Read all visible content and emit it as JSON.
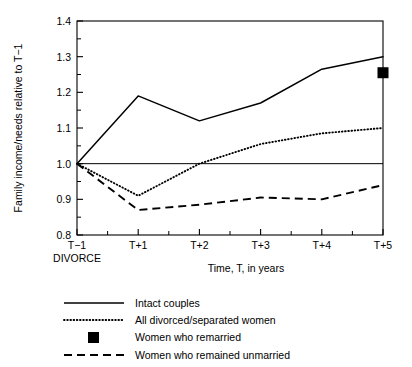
{
  "chart_data": {
    "type": "line",
    "title": "",
    "xlabel": "Time, T, in years",
    "ylabel": "Family income/needs relative to T−1",
    "categories": [
      "T−1",
      "T+1",
      "T+2",
      "T+3",
      "T+4",
      "T+5"
    ],
    "x_tick_labels": [
      "T−1",
      "T+1",
      "T+2",
      "T+3",
      "T+4",
      "T+5"
    ],
    "x_sub_label": "DIVORCE",
    "y_tick_labels": [
      "0.8",
      "0.9",
      "1.0",
      "1.1",
      "1.2",
      "1.3",
      "1.4"
    ],
    "y_tick_values": [
      0.8,
      0.9,
      1.0,
      1.1,
      1.2,
      1.3,
      1.4
    ],
    "ylim": [
      0.8,
      1.4
    ],
    "xlim": [
      0,
      5
    ],
    "grid": false,
    "minor_ticks": true,
    "reference_line_y": 1.0,
    "legend_position": "below",
    "series": [
      {
        "name": "Intact couples",
        "style": "solid",
        "values": [
          1.0,
          1.19,
          1.12,
          1.17,
          1.265,
          1.3
        ]
      },
      {
        "name": "All divorced/separated women",
        "style": "dotted",
        "values": [
          1.0,
          0.91,
          1.0,
          1.055,
          1.085,
          1.1
        ]
      },
      {
        "name": "Women who remained unmarried",
        "style": "dashed",
        "values": [
          1.0,
          0.87,
          0.885,
          0.905,
          0.9,
          0.94
        ]
      }
    ],
    "point_series": [
      {
        "name": "Women who remarried",
        "style": "square-marker",
        "x": 5,
        "value": 1.255
      }
    ],
    "legend_entries": [
      {
        "label": "Intact couples",
        "style": "solid"
      },
      {
        "label": "All divorced/separated women",
        "style": "dotted"
      },
      {
        "label": "Women who remarried",
        "style": "square-marker"
      },
      {
        "label": "Women who remained unmarried",
        "style": "dashed"
      }
    ]
  },
  "colors": {
    "ink": "#000000",
    "background": "#ffffff"
  }
}
